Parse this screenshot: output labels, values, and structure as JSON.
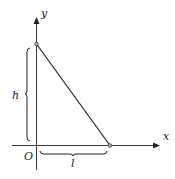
{
  "diagram": {
    "axes": {
      "x_label": "x",
      "y_label": "y",
      "origin_label": "O"
    },
    "segment": {
      "top_point": "(0, h)",
      "bottom_point": "(l, 0)"
    },
    "braces": {
      "vertical_label": "h",
      "horizontal_label": "l"
    },
    "colors": {
      "line": "#222222",
      "point_fill": "#bbbbbb"
    }
  }
}
